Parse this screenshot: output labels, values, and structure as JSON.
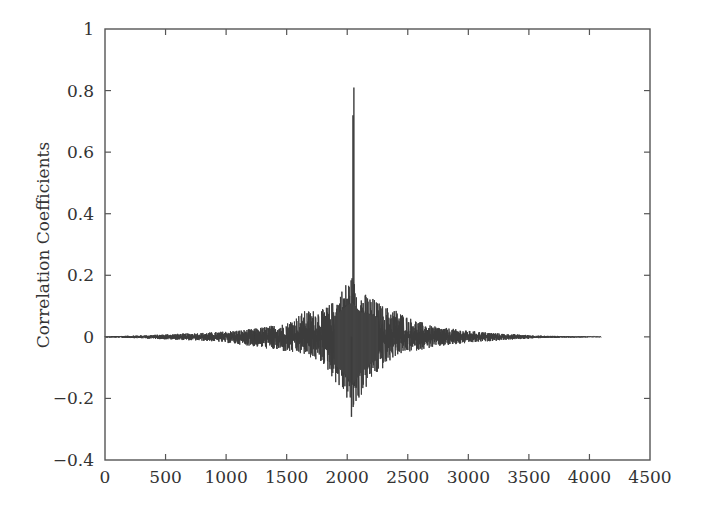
{
  "chart_data": {
    "type": "line",
    "title": "",
    "xlabel": "",
    "ylabel": "Correlation Coefficients",
    "xlim": [
      0,
      4500
    ],
    "ylim": [
      -0.4,
      1
    ],
    "grid": false,
    "legend": null,
    "x_ticks": [
      0,
      500,
      1000,
      1500,
      2000,
      2500,
      3000,
      3500,
      4000,
      4500
    ],
    "x_tick_labels": [
      "0",
      "500",
      "1000",
      "1500",
      "2000",
      "2500",
      "3000",
      "3500",
      "4000",
      "4500"
    ],
    "y_ticks": [
      1,
      0.8,
      0.6,
      0.4,
      0.2,
      0,
      -0.2,
      -0.4
    ],
    "y_tick_labels": [
      "1",
      "0.8",
      "0.6",
      "0.4",
      "0.2",
      "0",
      "−0.2",
      "−0.4"
    ],
    "series": [
      {
        "name": "correlation",
        "n_points": 4096,
        "x_range": [
          0,
          4095
        ],
        "peak": {
          "x": 2055,
          "y": 0.81
        },
        "secondary_peak": {
          "x": 2048,
          "y": 0.72
        },
        "envelope": {
          "x": [
            0,
            300,
            600,
            900,
            1200,
            1500,
            1650,
            1800,
            1900,
            2000,
            2040,
            2100,
            2200,
            2300,
            2400,
            2500,
            2700,
            3000,
            3300,
            3600,
            4095
          ],
          "max": [
            0.002,
            0.005,
            0.01,
            0.015,
            0.025,
            0.045,
            0.085,
            0.09,
            0.12,
            0.185,
            0.2,
            0.15,
            0.13,
            0.1,
            0.09,
            0.065,
            0.035,
            0.02,
            0.01,
            0.004,
            0.001
          ],
          "min": [
            -0.002,
            -0.005,
            -0.01,
            -0.015,
            -0.03,
            -0.05,
            -0.06,
            -0.09,
            -0.15,
            -0.21,
            -0.26,
            -0.2,
            -0.14,
            -0.1,
            -0.06,
            -0.05,
            -0.035,
            -0.02,
            -0.01,
            -0.004,
            -0.001
          ]
        }
      }
    ]
  }
}
